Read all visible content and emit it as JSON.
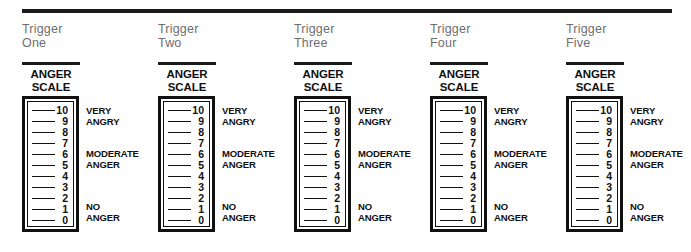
{
  "worksheet": {
    "top_rule": true,
    "columns": [
      {
        "trigger_label": "Trigger\nOne",
        "scale_title": "ANGER\nSCALE",
        "ticks": [
          "10",
          "9",
          "8",
          "7",
          "6",
          "5",
          "4",
          "3",
          "2",
          "1",
          "0"
        ],
        "side_labels": [
          {
            "text": "VERY",
            "at_tick": "10"
          },
          {
            "text": "ANGRY",
            "at_tick": "9"
          },
          {
            "text": "MODERATE",
            "at_tick": "6"
          },
          {
            "text": "ANGER",
            "at_tick": "5"
          },
          {
            "text": "NO",
            "at_tick": "1"
          },
          {
            "text": "ANGER",
            "at_tick": "0"
          }
        ]
      },
      {
        "trigger_label": "Trigger\nTwo",
        "scale_title": "ANGER\nSCALE",
        "ticks": [
          "10",
          "9",
          "8",
          "7",
          "6",
          "5",
          "4",
          "3",
          "2",
          "1",
          "0"
        ],
        "side_labels": [
          {
            "text": "VERY",
            "at_tick": "10"
          },
          {
            "text": "ANGRY",
            "at_tick": "9"
          },
          {
            "text": "MODERATE",
            "at_tick": "6"
          },
          {
            "text": "ANGER",
            "at_tick": "5"
          },
          {
            "text": "NO",
            "at_tick": "1"
          },
          {
            "text": "ANGER",
            "at_tick": "0"
          }
        ]
      },
      {
        "trigger_label": "Trigger\nThree",
        "scale_title": "ANGER\nSCALE",
        "ticks": [
          "10",
          "9",
          "8",
          "7",
          "6",
          "5",
          "4",
          "3",
          "2",
          "1",
          "0"
        ],
        "side_labels": [
          {
            "text": "VERY",
            "at_tick": "10"
          },
          {
            "text": "ANGRY",
            "at_tick": "9"
          },
          {
            "text": "MODERATE",
            "at_tick": "6"
          },
          {
            "text": "ANGER",
            "at_tick": "5"
          },
          {
            "text": "NO",
            "at_tick": "1"
          },
          {
            "text": "ANGER",
            "at_tick": "0"
          }
        ]
      },
      {
        "trigger_label": "Trigger\nFour",
        "scale_title": "ANGER\nSCALE",
        "ticks": [
          "10",
          "9",
          "8",
          "7",
          "6",
          "5",
          "4",
          "3",
          "2",
          "1",
          "0"
        ],
        "side_labels": [
          {
            "text": "VERY",
            "at_tick": "10"
          },
          {
            "text": "ANGRY",
            "at_tick": "9"
          },
          {
            "text": "MODERATE",
            "at_tick": "6"
          },
          {
            "text": "ANGER",
            "at_tick": "5"
          },
          {
            "text": "NO",
            "at_tick": "1"
          },
          {
            "text": "ANGER",
            "at_tick": "0"
          }
        ]
      },
      {
        "trigger_label": "Trigger\nFive",
        "scale_title": "ANGER\nSCALE",
        "ticks": [
          "10",
          "9",
          "8",
          "7",
          "6",
          "5",
          "4",
          "3",
          "2",
          "1",
          "0"
        ],
        "side_labels": [
          {
            "text": "VERY",
            "at_tick": "10"
          },
          {
            "text": "ANGRY",
            "at_tick": "9"
          },
          {
            "text": "MODERATE",
            "at_tick": "6"
          },
          {
            "text": "ANGER",
            "at_tick": "5"
          },
          {
            "text": "NO",
            "at_tick": "1"
          },
          {
            "text": "ANGER",
            "at_tick": "0"
          }
        ]
      }
    ],
    "colors": {
      "ink": "#111111",
      "rule": "#1a1a1a",
      "heading_gray": "#6d6d6d",
      "paper": "#ffffff"
    },
    "layout": {
      "column_start_x": 22,
      "column_spacing": 136
    }
  }
}
